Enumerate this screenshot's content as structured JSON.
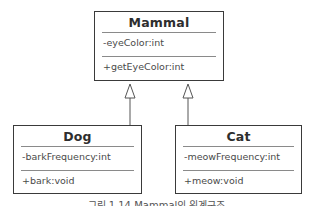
{
  "diagram": {
    "type": "uml-class-hierarchy",
    "classes": [
      {
        "name": "Mammal",
        "attributes": [
          "-eyeColor:int"
        ],
        "methods": [
          "+getEyeColor:int"
        ]
      },
      {
        "name": "Dog",
        "attributes": [
          "-barkFrequency:int"
        ],
        "methods": [
          "+bark:void"
        ]
      },
      {
        "name": "Cat",
        "attributes": [
          "-meowFrequency:int"
        ],
        "methods": [
          "+meow:void"
        ]
      }
    ],
    "relationships": [
      {
        "from": "Dog",
        "to": "Mammal",
        "type": "generalization"
      },
      {
        "from": "Cat",
        "to": "Mammal",
        "type": "generalization"
      }
    ],
    "caption": "그림 1.14 Mammal의 위계구조"
  },
  "colors": {
    "border": "#3a3a3a",
    "divider": "#8a8a8a",
    "text": "#333333",
    "background": "#ffffff"
  }
}
